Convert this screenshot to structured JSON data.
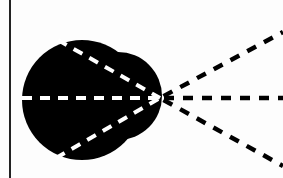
{
  "diagram": {
    "colors": {
      "background": "#fdfdfd",
      "shape_fill": "#000000",
      "inner_dash": "#ffffff",
      "outer_dash": "#000000",
      "frame_line": "#222222"
    },
    "frame_line": {
      "x": 10,
      "y1": 0,
      "y2": 178
    },
    "blob": {
      "discs": [
        {
          "cx": 82,
          "cy": 100,
          "r": 60
        },
        {
          "cx": 118,
          "cy": 96,
          "r": 44
        }
      ]
    },
    "vertex": {
      "x": 160,
      "y": 98
    },
    "inner_rays": [
      {
        "x": 58,
        "y": 40
      },
      {
        "x": 22,
        "y": 98
      },
      {
        "x": 56,
        "y": 158
      }
    ],
    "outer_rays": [
      {
        "x": 283,
        "y": 32
      },
      {
        "x": 283,
        "y": 98
      },
      {
        "x": 283,
        "y": 166
      }
    ]
  }
}
